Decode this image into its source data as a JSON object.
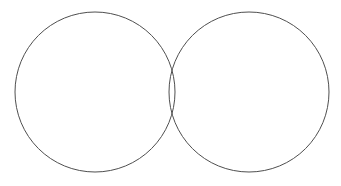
{
  "figure": {
    "name": "two-overlapping-circles",
    "width": 341,
    "height": 186,
    "background_color": "#ffffff",
    "stroke_color": "#4f4f4f",
    "stroke_width": 1,
    "fill": "none",
    "shapes": [
      {
        "id": "left-circle",
        "label": "Left circle",
        "type": "circle",
        "cx": 95,
        "cy": 92,
        "r": 80
      },
      {
        "id": "right-circle",
        "label": "Right circle",
        "type": "circle",
        "cx": 249,
        "cy": 92,
        "r": 80
      }
    ],
    "overlap": {
      "label": "Lens intersection",
      "center_x": 172,
      "top_y": 71,
      "bottom_y": 113,
      "max_width": 6,
      "center_distance": 154
    }
  }
}
